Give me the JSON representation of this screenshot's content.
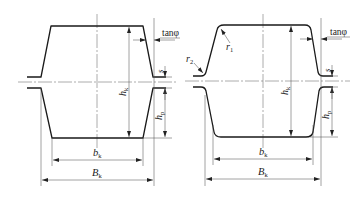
{
  "figure": {
    "left_profile": {
      "type": "trapezoidal",
      "labels": {
        "height_k": "h",
        "height_k_sub": "k",
        "height_p": "h",
        "height_p_sub": "p",
        "gap": "s",
        "taper": "tanφ",
        "inner_width": "b",
        "inner_width_sub": "k",
        "outer_width": "B",
        "outer_width_sub": "k"
      }
    },
    "right_profile": {
      "type": "rounded-trapezoidal",
      "labels": {
        "height_k": "h",
        "height_k_sub": "k",
        "height_p": "h",
        "height_p_sub": "p",
        "gap": "s",
        "taper": "tanφ",
        "radius_1": "r",
        "radius_1_sub": "1",
        "radius_2": "r",
        "radius_2_sub": "2",
        "inner_width": "b",
        "inner_width_sub": "k",
        "outer_width": "B",
        "outer_width_sub": "k"
      }
    },
    "colors": {
      "line": "#1a1a1a",
      "background": "#ffffff"
    }
  }
}
